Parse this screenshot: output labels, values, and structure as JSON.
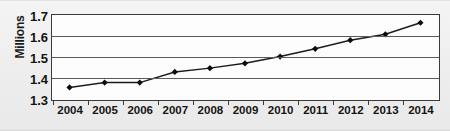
{
  "chart_data": {
    "type": "line",
    "title": "",
    "xlabel": "",
    "ylabel": "Millions",
    "categories": [
      "2004",
      "2005",
      "2006",
      "2007",
      "2008",
      "2009",
      "2010",
      "2011",
      "2012",
      "2013",
      "2014"
    ],
    "values": [
      1.355,
      1.378,
      1.378,
      1.429,
      1.447,
      1.47,
      1.502,
      1.539,
      1.58,
      1.608,
      1.663
    ],
    "series": [
      {
        "name": "Millions",
        "values": [
          1.355,
          1.378,
          1.378,
          1.429,
          1.447,
          1.47,
          1.502,
          1.539,
          1.58,
          1.608,
          1.663
        ]
      }
    ],
    "ylim": [
      1.3,
      1.7
    ],
    "ytick_labels": [
      "1.3",
      "1.4",
      "1.5",
      "1.6",
      "1.7"
    ],
    "ytick_values": [
      1.3,
      1.4,
      1.5,
      1.6,
      1.7
    ],
    "xtick_labels": [
      "2004",
      "2005",
      "2006",
      "2007",
      "2008",
      "2009",
      "2010",
      "2011",
      "2012",
      "2013",
      "2014"
    ],
    "grid": "horizontal",
    "legend": "none",
    "marker": "filled-diamond",
    "line_color": "#1c1c1c",
    "marker_color": "#0d0d0d",
    "grid_color": "#5a5a5a",
    "plot_background": "#fdfdfd",
    "page_background": "#eeeeee"
  }
}
